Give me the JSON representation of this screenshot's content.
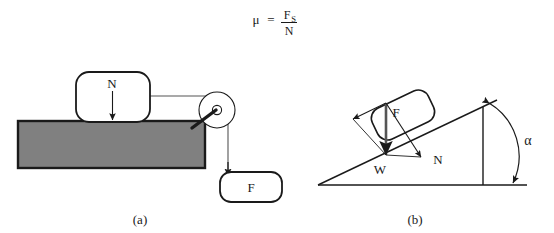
{
  "figure": {
    "formula": {
      "symbol": "μ",
      "equals": "=",
      "numerator": "F",
      "numerator_subscript": "S",
      "denominator": "N"
    },
    "panels": [
      {
        "id": "panel-a",
        "caption": "(a)",
        "description": "Block on horizontal surface with normal force N and pulling force F over a pulley",
        "labels": {
          "normal_force": "N",
          "applied_force": "F"
        },
        "colors": {
          "surface_fill": "#808080",
          "outline": "#1a1a1a",
          "background": "#ffffff"
        }
      },
      {
        "id": "panel-b",
        "caption": "(b)",
        "description": "Block resting on an inclined plane with force vectors F, N and W and incline angle alpha",
        "labels": {
          "friction_force": "F",
          "normal_force": "N",
          "weight": "W",
          "angle": "α"
        },
        "colors": {
          "outline": "#1a1a1a",
          "background": "#ffffff"
        }
      }
    ]
  }
}
